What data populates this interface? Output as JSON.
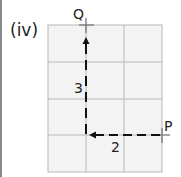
{
  "diagram": {
    "part_label": "(iv)",
    "grid": {
      "columns": 3,
      "rows": 4,
      "line_color": "#b8b8b8",
      "fill_color": "#f3f3f3"
    },
    "points": {
      "start": {
        "label": "P"
      },
      "end": {
        "label": "Q"
      }
    },
    "moves": [
      {
        "direction": "left",
        "steps": "2"
      },
      {
        "direction": "up",
        "steps": "3"
      }
    ],
    "path_color": "#111111"
  }
}
